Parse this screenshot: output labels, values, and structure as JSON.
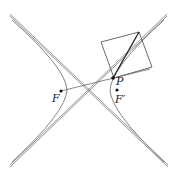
{
  "diagram": {
    "type": "hyperbola-construction",
    "labels": {
      "focus_left": "F",
      "focus_right": "F′",
      "point": "P"
    },
    "colors": {
      "stroke": "#555555",
      "point": "#111111",
      "background": "#ffffff"
    },
    "points": {
      "F": [
        61,
        91
      ],
      "F_prime": [
        117,
        90
      ],
      "P": [
        113,
        78
      ]
    }
  }
}
